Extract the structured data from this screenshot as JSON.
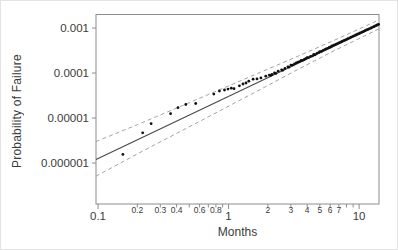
{
  "figure": {
    "y_axis_title": "Probability of Failure",
    "x_axis_title": "Months"
  },
  "chart_data": {
    "type": "scatter",
    "title": "",
    "xlabel": "Months",
    "ylabel": "Probability of Failure",
    "x_scale": "log",
    "y_scale": "log",
    "x_range": [
      0.0965,
      14.2
    ],
    "y_range": [
      1.23e-07,
      0.002
    ],
    "grid": "off",
    "legend": "none",
    "x_ticks": [
      {
        "v": 0.1,
        "label": "0.1",
        "major": true
      },
      {
        "v": 0.2,
        "label": "0.2",
        "major": false
      },
      {
        "v": 0.3,
        "label": "0.3",
        "major": false
      },
      {
        "v": 0.4,
        "label": "0.4",
        "major": false
      },
      {
        "v": 0.5,
        "label": "",
        "major": false
      },
      {
        "v": 0.6,
        "label": "0.6",
        "major": false
      },
      {
        "v": 0.7,
        "label": "",
        "major": false
      },
      {
        "v": 0.8,
        "label": "0.8",
        "major": false
      },
      {
        "v": 0.9,
        "label": "",
        "major": false
      },
      {
        "v": 1,
        "label": "1",
        "major": true
      },
      {
        "v": 2,
        "label": "2",
        "major": false
      },
      {
        "v": 3,
        "label": "3",
        "major": false
      },
      {
        "v": 4,
        "label": "4",
        "major": false
      },
      {
        "v": 5,
        "label": "5",
        "major": false
      },
      {
        "v": 6,
        "label": "6",
        "major": false
      },
      {
        "v": 7,
        "label": "7",
        "major": false
      },
      {
        "v": 8,
        "label": "",
        "major": false
      },
      {
        "v": 9,
        "label": "",
        "major": false
      },
      {
        "v": 10,
        "label": "10",
        "major": true
      }
    ],
    "y_ticks": [
      {
        "v": 0.001,
        "label": "0.001"
      },
      {
        "v": 0.0001,
        "label": "0.0001"
      },
      {
        "v": 1e-05,
        "label": "0.00001"
      },
      {
        "v": 1e-06,
        "label": "0.000001"
      }
    ],
    "fit_line": [
      [
        0.0965,
        1.2e-06
      ],
      [
        14.2,
        0.00118
      ]
    ],
    "conf_upper": [
      [
        0.0965,
        3e-06
      ],
      [
        0.2,
        7.1e-06
      ],
      [
        0.4,
        1.66e-05
      ],
      [
        0.8,
        3.93e-05
      ],
      [
        1.6,
        9.3e-05
      ],
      [
        3.2,
        0.000219
      ],
      [
        6.4,
        0.00053
      ],
      [
        12.8,
        0.00132
      ],
      [
        14.2,
        0.00153
      ]
    ],
    "conf_lower": [
      [
        0.0965,
        5.1e-07
      ],
      [
        0.2,
        1.6e-06
      ],
      [
        0.4,
        4.55e-06
      ],
      [
        0.8,
        1.31e-05
      ],
      [
        1.6,
        3.76e-05
      ],
      [
        3.2,
        0.00011
      ],
      [
        6.4,
        0.00031
      ],
      [
        12.8,
        0.00083
      ],
      [
        14.2,
        0.00096
      ]
    ],
    "points": [
      [
        0.155,
        1.56e-06
      ],
      [
        0.22,
        4.7e-06
      ],
      [
        0.255,
        7.5e-06
      ],
      [
        0.36,
        1.25e-05
      ],
      [
        0.41,
        1.7e-05
      ],
      [
        0.47,
        2e-05
      ],
      [
        0.56,
        2.1e-05
      ],
      [
        0.77,
        3.4e-05
      ],
      [
        0.85,
        4e-05
      ],
      [
        0.93,
        4.2e-05
      ],
      [
        0.99,
        4.4e-05
      ],
      [
        1.05,
        4.6e-05
      ],
      [
        1.1,
        4.5e-05
      ],
      [
        1.21,
        5.2e-05
      ],
      [
        1.29,
        5.7e-05
      ],
      [
        1.36,
        6e-05
      ],
      [
        1.43,
        6.6e-05
      ],
      [
        1.54,
        7.3e-05
      ],
      [
        1.65,
        7.4e-05
      ],
      [
        1.77,
        7.8e-05
      ],
      [
        1.93,
        8.5e-05
      ],
      [
        2.05,
        9e-05
      ],
      [
        2.1,
        8.8e-05
      ],
      [
        2.15,
        9.3e-05
      ],
      [
        2.25,
        0.0001
      ],
      [
        2.3,
        9.8e-05
      ],
      [
        2.4,
        0.00011
      ],
      [
        2.55,
        0.000118
      ],
      [
        2.6,
        0.000115
      ],
      [
        2.7,
        0.000126
      ],
      [
        2.85,
        0.000138
      ],
      [
        2.9,
        0.000135
      ],
      [
        3.0,
        0.00015
      ],
      [
        3.1,
        0.00015
      ],
      [
        3.2,
        0.00016
      ],
      [
        3.3,
        0.000168
      ],
      [
        3.4,
        0.000175
      ],
      [
        3.5,
        0.00018
      ],
      [
        3.6,
        0.00019
      ],
      [
        3.7,
        0.000192
      ],
      [
        3.8,
        0.0002
      ],
      [
        3.9,
        0.000208
      ],
      [
        4.0,
        0.00022
      ],
      [
        4.1,
        0.00022
      ],
      [
        4.25,
        0.000235
      ],
      [
        4.4,
        0.000242
      ],
      [
        4.5,
        0.00026
      ],
      [
        4.6,
        0.000255
      ],
      [
        4.75,
        0.000275
      ],
      [
        4.9,
        0.000285
      ],
      [
        5.0,
        0.0003
      ],
      [
        5.15,
        0.000305
      ],
      [
        5.3,
        0.00032
      ],
      [
        5.45,
        0.00033
      ],
      [
        5.6,
        0.000345
      ],
      [
        5.75,
        0.000355
      ],
      [
        5.9,
        0.00037
      ],
      [
        6.05,
        0.00038
      ],
      [
        6.2,
        0.0004
      ],
      [
        6.4,
        0.000415
      ],
      [
        6.6,
        0.00043
      ],
      [
        6.8,
        0.00045
      ],
      [
        7.0,
        0.00047
      ],
      [
        7.2,
        0.000485
      ],
      [
        7.4,
        0.000505
      ],
      [
        7.6,
        0.000525
      ],
      [
        7.8,
        0.00054
      ],
      [
        8.0,
        0.00056
      ],
      [
        8.2,
        0.00058
      ],
      [
        8.45,
        0.000605
      ],
      [
        8.7,
        0.00063
      ],
      [
        8.95,
        0.000655
      ],
      [
        9.2,
        0.00068
      ],
      [
        9.45,
        0.0007
      ],
      [
        9.7,
        0.00073
      ],
      [
        9.95,
        0.00075
      ],
      [
        10.2,
        0.00078
      ],
      [
        10.5,
        0.00081
      ],
      [
        10.8,
        0.00084
      ],
      [
        11.1,
        0.000875
      ],
      [
        11.4,
        0.00091
      ],
      [
        11.7,
        0.00094
      ],
      [
        12.0,
        0.00097
      ],
      [
        12.35,
        0.001
      ],
      [
        12.7,
        0.00105
      ],
      [
        13.05,
        0.00108
      ],
      [
        13.4,
        0.00113
      ],
      [
        13.75,
        0.00117
      ],
      [
        14.1,
        0.00121
      ]
    ],
    "colors": {
      "point": "#111111",
      "fit_line": "#4a4a4a",
      "confidence_band": "#999999",
      "frame": "#8c8c8c",
      "tick": "#8c8c8c",
      "label_text": "#3a3a3a"
    }
  }
}
